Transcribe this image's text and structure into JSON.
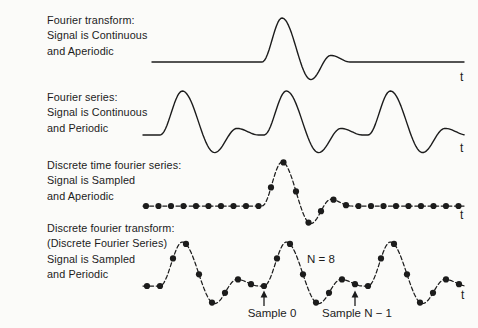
{
  "figure": {
    "background": "#fbfbf9",
    "ink": "#1c1c1c"
  },
  "rows": [
    {
      "key": "fourier-transform",
      "title_lines": [
        "Fourier transform:",
        "Signal is Continuous",
        "and Aperiodic"
      ],
      "signal": "continuous",
      "periodicity": "aperiodic",
      "axis_label": "t"
    },
    {
      "key": "fourier-series",
      "title_lines": [
        "Fourier series:",
        "Signal is Continuous",
        "and Periodic"
      ],
      "signal": "continuous",
      "periodicity": "periodic",
      "axis_label": "t"
    },
    {
      "key": "discrete-time-fourier-series",
      "title_lines": [
        "Discrete time fourier series:",
        "Signal is Sampled",
        "and Aperiodic"
      ],
      "signal": "sampled",
      "periodicity": "aperiodic",
      "axis_label": "t"
    },
    {
      "key": "discrete-fourier-transform",
      "title_lines": [
        "Discrete fourier transform:",
        "(Discrete Fourier Series)",
        "Signal is Sampled",
        "and Periodic"
      ],
      "signal": "sampled",
      "periodicity": "periodic",
      "axis_label": "t"
    }
  ],
  "annotations": {
    "n_samples": "N = 8",
    "sample_first": "Sample 0",
    "sample_last": "Sample N − 1"
  },
  "waveform_spec": {
    "pulse_keypoints": [
      [
        0,
        0
      ],
      [
        0.215,
        1
      ],
      [
        0.525,
        -0.4
      ],
      [
        0.74,
        0.15
      ],
      [
        0.95,
        0
      ],
      [
        1,
        0
      ]
    ],
    "amplitude_px": 44,
    "period_px": 104,
    "samples_per_period": 8,
    "rows": [
      {
        "baseline_y": 62,
        "x_start": 152,
        "x_end": 465,
        "mode": "aperiodic",
        "style": "continuous",
        "pulse_x": 262,
        "pulse_w": 93
      },
      {
        "baseline_y": 135,
        "x_start": 143,
        "x_end": 465,
        "mode": "periodic",
        "style": "continuous",
        "first_period_x": 160
      },
      {
        "baseline_y": 206,
        "x_start": 143,
        "x_end": 464,
        "mode": "aperiodic",
        "style": "sampled",
        "pulse_x": 262,
        "pulse_w": 93,
        "dot_start": 146,
        "dot_spacing": 12.5
      },
      {
        "baseline_y": 286,
        "x_start": 143,
        "x_end": 464,
        "mode": "periodic",
        "style": "sampled",
        "first_period_x": 160,
        "dot_start": 147,
        "dot_spacing": 13
      }
    ]
  }
}
